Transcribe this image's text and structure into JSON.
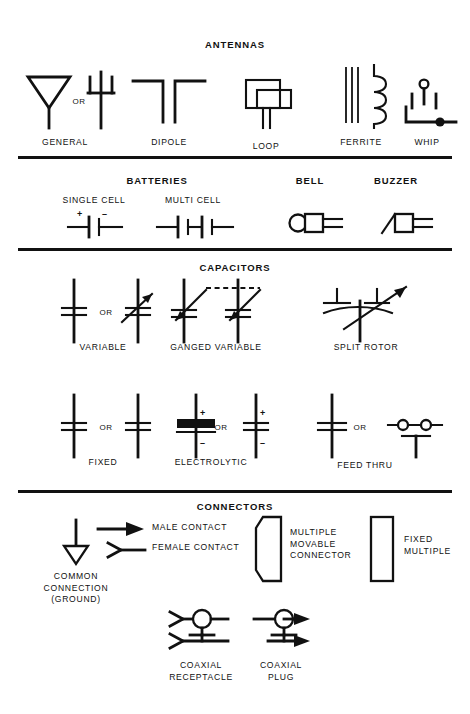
{
  "page": {
    "ink_color": "#111111",
    "background_color": "#ffffff"
  },
  "sections": [
    {
      "id": "antennas",
      "title": "ANTENNAS",
      "items": [
        {
          "id": "general",
          "caption": "GENERAL",
          "or_label": "OR",
          "symbol": "antenna-general"
        },
        {
          "id": "dipole",
          "caption": "DIPOLE",
          "symbol": "antenna-dipole"
        },
        {
          "id": "loop",
          "caption": "LOOP",
          "symbol": "antenna-loop"
        },
        {
          "id": "ferrite",
          "caption": "FERRITE",
          "symbol": "antenna-ferrite"
        },
        {
          "id": "whip",
          "caption": "WHIP",
          "symbol": "antenna-whip"
        }
      ]
    },
    {
      "id": "batteries",
      "title": "BATTERIES",
      "extra_titles": [
        {
          "id": "bell",
          "title": "BELL"
        },
        {
          "id": "buzzer",
          "title": "BUZZER"
        }
      ],
      "items": [
        {
          "id": "single-cell",
          "caption": "SINGLE CELL",
          "symbol": "battery-single-cell",
          "plus": "+",
          "minus": "–"
        },
        {
          "id": "multi-cell",
          "caption": "MULTI CELL",
          "symbol": "battery-multi-cell"
        },
        {
          "id": "bell",
          "caption": "",
          "symbol": "bell"
        },
        {
          "id": "buzzer",
          "caption": "",
          "symbol": "buzzer"
        }
      ]
    },
    {
      "id": "capacitors",
      "title": "CAPACITORS",
      "items": [
        {
          "id": "variable",
          "caption": "VARIABLE",
          "or_label": "OR",
          "symbol": "capacitor-variable"
        },
        {
          "id": "ganged-variable",
          "caption": "GANGED VARIABLE",
          "symbol": "capacitor-ganged-variable"
        },
        {
          "id": "split-rotor",
          "caption": "SPLIT ROTOR",
          "symbol": "capacitor-split-rotor"
        },
        {
          "id": "fixed",
          "caption": "FIXED",
          "or_label": "OR",
          "symbol": "capacitor-fixed"
        },
        {
          "id": "electrolytic",
          "caption": "ELECTROLYTIC",
          "or_label": "OR",
          "symbol": "capacitor-electrolytic",
          "plus": "+",
          "minus": "–"
        },
        {
          "id": "feed-thru",
          "caption": "FEED THRU",
          "or_label": "OR",
          "symbol": "capacitor-feed-thru"
        }
      ]
    },
    {
      "id": "connectors",
      "title": "CONNECTORS",
      "items": [
        {
          "id": "common-connection",
          "caption": "COMMON\nCONNECTION\n(GROUND)",
          "symbol": "ground-common-connection"
        },
        {
          "id": "male-contact",
          "label": "MALE CONTACT",
          "symbol": "male-contact"
        },
        {
          "id": "female-contact",
          "label": "FEMALE CONTACT",
          "symbol": "female-contact"
        },
        {
          "id": "multiple-movable",
          "label": "MULTIPLE\nMOVABLE\nCONNECTOR",
          "symbol": "multiple-movable-connector"
        },
        {
          "id": "fixed-multiple",
          "label": "FIXED\nMULTIPLE",
          "symbol": "fixed-multiple"
        },
        {
          "id": "coaxial-receptacle",
          "caption": "COAXIAL\nRECEPTACLE",
          "symbol": "coaxial-receptacle"
        },
        {
          "id": "coaxial-plug",
          "caption": "COAXIAL\nPLUG",
          "symbol": "coaxial-plug"
        }
      ]
    }
  ]
}
